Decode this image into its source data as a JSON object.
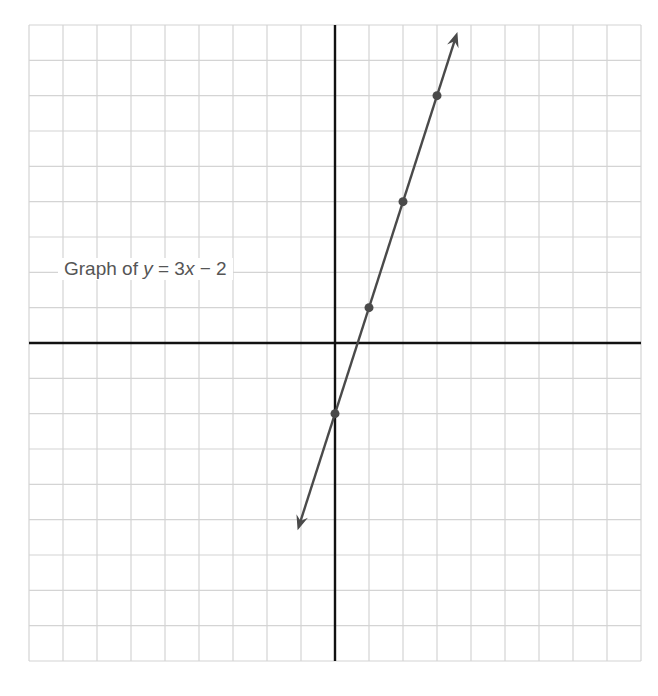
{
  "chart_data": {
    "type": "line",
    "title": "Graph of y = 3x − 2",
    "annotation": {
      "prefix": "Graph of ",
      "var_y": "y",
      "equals": " = 3",
      "var_x": "x",
      "suffix": " − 2"
    },
    "equation": "y = 3x - 2",
    "xlabel": "",
    "ylabel": "",
    "xlim": [
      -9,
      9
    ],
    "ylim": [
      -9,
      9
    ],
    "grid": true,
    "axes_visible": true,
    "tick_labels": false,
    "series": [
      {
        "name": "y = 3x - 2",
        "x": [
          0,
          1,
          2,
          3
        ],
        "y": [
          -2,
          1,
          4,
          7
        ],
        "marked_points": [
          [
            0,
            -2
          ],
          [
            1,
            1
          ],
          [
            2,
            4
          ],
          [
            3,
            7
          ]
        ],
        "arrows_both_ends": true,
        "line_extent": {
          "x_start": -1.1,
          "y_start": -5.3,
          "x_end": 3.6,
          "y_end": 8.8
        }
      }
    ]
  },
  "colors": {
    "grid": "#d4d4d4",
    "axes": "#111111",
    "line": "#4a4a4a",
    "points": "#4a4a4a",
    "text": "#555555"
  }
}
